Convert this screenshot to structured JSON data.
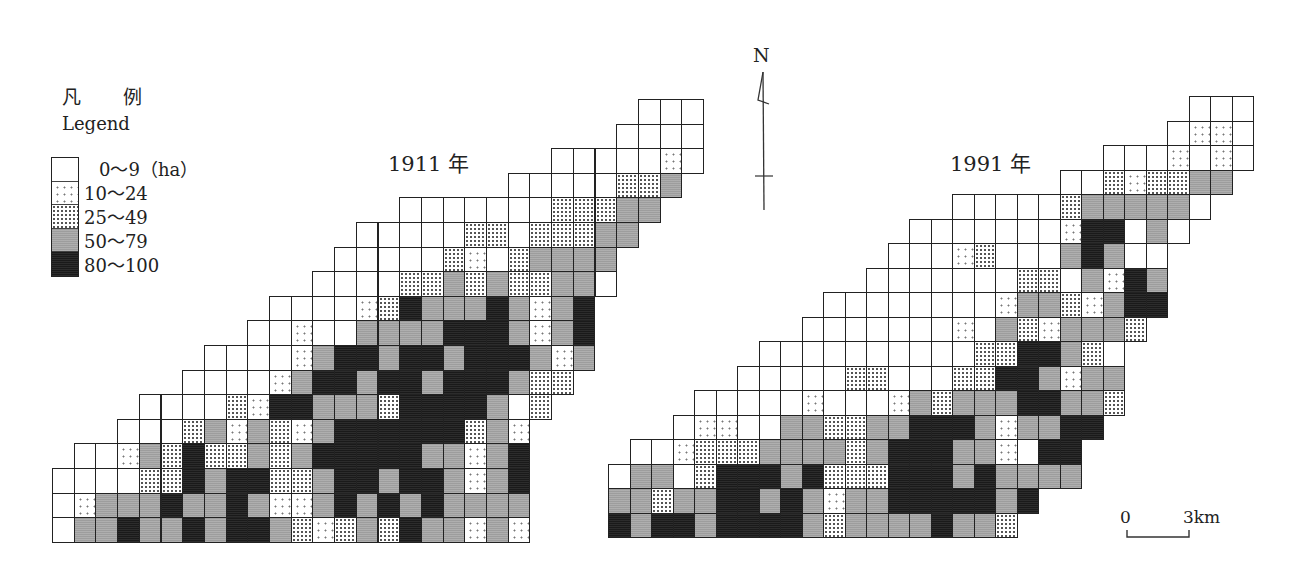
{
  "legend": {
    "title": "凡 例",
    "subtitle": "Legend",
    "unit": "ha",
    "classes": [
      {
        "level": 0,
        "label": "0～9（ha）",
        "pattern": "white"
      },
      {
        "level": 1,
        "label": "10～24",
        "pattern": "sparse-dots"
      },
      {
        "level": 2,
        "label": "25～49",
        "pattern": "dense-dots"
      },
      {
        "level": 3,
        "label": "50～79",
        "pattern": "gray"
      },
      {
        "level": 4,
        "label": "80～100",
        "pattern": "black"
      }
    ]
  },
  "maps": [
    {
      "title": "1911 年",
      "year": 1911,
      "origin_x": 52,
      "origin_y": 99,
      "cell_w": 21.7,
      "cell_h": 24.6,
      "rows": [
        {
          "start": 27,
          "cells": [
            0,
            0,
            0
          ]
        },
        {
          "start": 26,
          "cells": [
            0,
            0,
            0,
            0
          ]
        },
        {
          "start": 23,
          "cells": [
            0,
            0,
            0,
            0,
            0,
            1,
            0
          ]
        },
        {
          "start": 21,
          "cells": [
            0,
            0,
            0,
            0,
            0,
            2,
            2,
            3
          ]
        },
        {
          "start": 16,
          "cells": [
            0,
            0,
            0,
            0,
            0,
            0,
            0,
            2,
            2,
            2,
            3,
            3
          ]
        },
        {
          "start": 14,
          "cells": [
            0,
            0,
            0,
            0,
            0,
            2,
            2,
            0,
            2,
            2,
            2,
            3,
            3
          ]
        },
        {
          "start": 13,
          "cells": [
            0,
            0,
            0,
            0,
            0,
            2,
            1,
            0,
            2,
            3,
            3,
            3,
            3
          ]
        },
        {
          "start": 12,
          "cells": [
            0,
            0,
            0,
            0,
            2,
            2,
            3,
            2,
            3,
            2,
            2,
            3,
            3,
            0
          ]
        },
        {
          "start": 10,
          "cells": [
            0,
            0,
            0,
            0,
            1,
            2,
            4,
            3,
            3,
            3,
            4,
            3,
            1,
            3,
            4
          ]
        },
        {
          "start": 9,
          "cells": [
            0,
            0,
            1,
            0,
            0,
            3,
            3,
            3,
            3,
            4,
            4,
            4,
            3,
            1,
            3,
            4
          ]
        },
        {
          "start": 7,
          "cells": [
            0,
            0,
            0,
            0,
            1,
            3,
            4,
            4,
            3,
            4,
            4,
            3,
            4,
            4,
            4,
            3,
            1,
            3
          ]
        },
        {
          "start": 6,
          "cells": [
            0,
            0,
            0,
            0,
            1,
            3,
            4,
            4,
            3,
            4,
            4,
            3,
            4,
            4,
            4,
            3,
            2,
            2
          ]
        },
        {
          "start": 4,
          "cells": [
            0,
            0,
            0,
            0,
            2,
            1,
            4,
            4,
            3,
            3,
            3,
            2,
            4,
            4,
            4,
            4,
            3,
            0,
            2
          ]
        },
        {
          "start": 3,
          "cells": [
            0,
            0,
            0,
            2,
            3,
            1,
            3,
            2,
            1,
            3,
            4,
            4,
            4,
            4,
            4,
            4,
            2,
            3,
            1
          ]
        },
        {
          "start": 1,
          "cells": [
            0,
            0,
            1,
            3,
            2,
            4,
            2,
            2,
            3,
            2,
            3,
            4,
            4,
            4,
            4,
            4,
            3,
            3,
            1,
            3,
            4
          ]
        },
        {
          "start": 0,
          "cells": [
            0,
            0,
            0,
            0,
            2,
            2,
            4,
            3,
            4,
            4,
            2,
            2,
            3,
            4,
            4,
            3,
            4,
            4,
            3,
            1,
            3,
            4
          ]
        },
        {
          "start": 0,
          "cells": [
            0,
            1,
            3,
            3,
            3,
            4,
            3,
            3,
            4,
            3,
            1,
            1,
            3,
            4,
            3,
            4,
            3,
            4,
            3,
            3,
            3,
            3
          ]
        },
        {
          "start": 0,
          "cells": [
            0,
            3,
            3,
            4,
            3,
            3,
            4,
            3,
            4,
            4,
            3,
            2,
            1,
            2,
            3,
            2,
            4,
            3,
            3,
            1,
            3,
            1
          ]
        }
      ]
    },
    {
      "title": "1991 年",
      "year": 1991,
      "origin_x": 608,
      "origin_y": 96,
      "cell_w": 21.5,
      "cell_h": 24.5,
      "rows": [
        {
          "start": 27,
          "cells": [
            0,
            0,
            0
          ]
        },
        {
          "start": 26,
          "cells": [
            0,
            1,
            1,
            0
          ]
        },
        {
          "start": 23,
          "cells": [
            0,
            0,
            0,
            1,
            0,
            1,
            0
          ]
        },
        {
          "start": 21,
          "cells": [
            0,
            0,
            2,
            1,
            2,
            2,
            3,
            3
          ]
        },
        {
          "start": 16,
          "cells": [
            0,
            0,
            0,
            0,
            0,
            2,
            3,
            3,
            3,
            3,
            3,
            0
          ]
        },
        {
          "start": 14,
          "cells": [
            0,
            0,
            0,
            0,
            0,
            0,
            0,
            1,
            4,
            4,
            0,
            3,
            0
          ]
        },
        {
          "start": 13,
          "cells": [
            0,
            0,
            0,
            1,
            2,
            0,
            0,
            0,
            3,
            4,
            3,
            0,
            0
          ]
        },
        {
          "start": 12,
          "cells": [
            0,
            0,
            0,
            0,
            0,
            0,
            0,
            2,
            2,
            0,
            3,
            1,
            4,
            3
          ]
        },
        {
          "start": 10,
          "cells": [
            0,
            0,
            0,
            0,
            0,
            0,
            0,
            0,
            1,
            3,
            3,
            2,
            1,
            3,
            4,
            4
          ]
        },
        {
          "start": 9,
          "cells": [
            0,
            0,
            0,
            0,
            0,
            0,
            0,
            1,
            0,
            3,
            2,
            1,
            3,
            3,
            3,
            2
          ]
        },
        {
          "start": 7,
          "cells": [
            0,
            0,
            0,
            0,
            0,
            0,
            0,
            0,
            0,
            0,
            2,
            2,
            4,
            4,
            3,
            2,
            0
          ]
        },
        {
          "start": 6,
          "cells": [
            0,
            0,
            0,
            0,
            0,
            2,
            2,
            0,
            0,
            0,
            2,
            2,
            4,
            4,
            3,
            1,
            3,
            3
          ]
        },
        {
          "start": 4,
          "cells": [
            0,
            0,
            0,
            0,
            0,
            1,
            0,
            0,
            0,
            1,
            3,
            2,
            3,
            3,
            3,
            4,
            4,
            3,
            3,
            2
          ]
        },
        {
          "start": 3,
          "cells": [
            0,
            1,
            1,
            0,
            0,
            3,
            3,
            2,
            2,
            3,
            3,
            4,
            4,
            4,
            3,
            1,
            3,
            3,
            4,
            4
          ]
        },
        {
          "start": 1,
          "cells": [
            0,
            0,
            1,
            2,
            2,
            2,
            3,
            3,
            3,
            3,
            2,
            3,
            4,
            4,
            4,
            3,
            3,
            1,
            0,
            4,
            4
          ]
        },
        {
          "start": 0,
          "cells": [
            0,
            3,
            3,
            0,
            2,
            4,
            4,
            4,
            3,
            4,
            2,
            2,
            2,
            4,
            4,
            4,
            3,
            4,
            3,
            3,
            3,
            3
          ]
        },
        {
          "start": 0,
          "cells": [
            3,
            3,
            2,
            3,
            3,
            4,
            4,
            3,
            4,
            3,
            1,
            3,
            3,
            4,
            4,
            4,
            4,
            4,
            3,
            4
          ]
        },
        {
          "start": 0,
          "cells": [
            4,
            3,
            4,
            4,
            3,
            4,
            4,
            4,
            4,
            3,
            2,
            3,
            3,
            3,
            3,
            4,
            3,
            3,
            2
          ]
        }
      ]
    }
  ],
  "north_arrow": {
    "label": "N"
  },
  "scale_bar": {
    "start_label": "0",
    "end_label": "3km",
    "distance_km": 3
  },
  "colors": {
    "level0": "#ffffff",
    "level1": "#f4f4f4",
    "level2": "#e0e0e0",
    "level3": "#9d9d9d",
    "level4": "#1a1a1a",
    "line": "#222222"
  },
  "chart_data": {
    "type": "heatmap",
    "legend": [
      "0～9 (ha)",
      "10～24",
      "25～49",
      "50～79",
      "80～100"
    ],
    "panels": [
      "1911 年",
      "1991 年"
    ],
    "scale": "0 — 3 km",
    "north": "N"
  }
}
